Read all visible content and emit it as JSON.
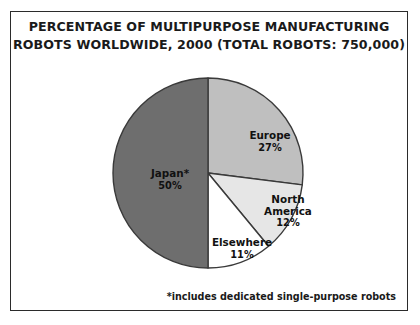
{
  "figure": {
    "title_line1": "PERCENTAGE OF MULTIPURPOSE MANUFACTURING",
    "title_line2": "ROBOTS WORLDWIDE, 2000 (TOTAL ROBOTS: 750,000)",
    "footnote": "*includes dedicated single-purpose robots",
    "frame_color": "#2b2b2b",
    "background": "#ffffff"
  },
  "chart_data": {
    "type": "pie",
    "title": "PERCENTAGE OF MULTIPURPOSE MANUFACTURING ROBOTS WORLDWIDE, 2000 (TOTAL ROBOTS: 750,000)",
    "total_robots": "750,000",
    "units": "percent",
    "start_angle_deg": 0,
    "direction": "clockwise",
    "legend": "none (labels drawn on slices)",
    "slices": [
      {
        "label": "Europe",
        "name_text": "Europe",
        "value": 27,
        "value_text": "27%",
        "color": "#bfbfbf",
        "label_x": 259,
        "label_y": 130
      },
      {
        "label": "North America",
        "name_text": "North\nAmerica",
        "name_line1": "North",
        "name_line2": "America",
        "value": 12,
        "value_text": "12%",
        "color": "#e6e6e6",
        "label_x": 277,
        "label_y": 199
      },
      {
        "label": "Elsewhere",
        "name_text": "Elsewhere",
        "value": 11,
        "value_text": "11%",
        "color": "#ffffff",
        "label_x": 231,
        "label_y": 237
      },
      {
        "label": "Japan*",
        "name_text": "Japan*",
        "value": 50,
        "value_text": "50%",
        "color": "#6e6e6e",
        "label_x": 159,
        "label_y": 168
      }
    ],
    "annotations": [
      "*includes dedicated single-purpose robots"
    ]
  }
}
